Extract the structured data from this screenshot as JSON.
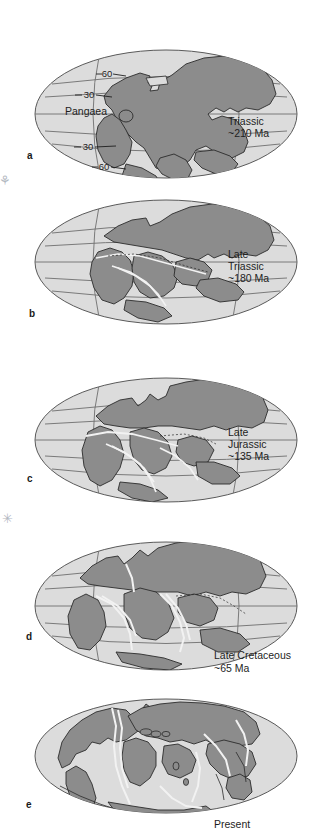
{
  "figure": {
    "colors": {
      "land": "#8c8c8c",
      "land_stroke": "#2b2b2b",
      "ocean": "#dcdcdc",
      "ocean_stroke": "#5a5a5a",
      "graticule": "#6e6e6e",
      "ridge": "#f2f2f2",
      "background": "#ffffff",
      "text": "#1e1e1e"
    }
  },
  "panels": [
    {
      "letter": "a",
      "caption": "Triassic\n~210 Ma",
      "caption_line1": "Triassic",
      "caption_line2": "~210 Ma",
      "supercontinent_label": "Pangaea",
      "latitude_labels": [
        "60",
        "30",
        "30",
        "60"
      ],
      "age_ma": 210,
      "epoch": "Triassic"
    },
    {
      "letter": "b",
      "caption": "Late\nTriassic\n~180 Ma",
      "caption_line1": "Late",
      "caption_line2": "Triassic",
      "caption_line3": "~180 Ma",
      "age_ma": 180,
      "epoch": "Late Triassic"
    },
    {
      "letter": "c",
      "caption": "Late\nJurassic\n~135 Ma",
      "caption_line1": "Late",
      "caption_line2": "Jurassic",
      "caption_line3": "~135 Ma",
      "age_ma": 135,
      "epoch": "Late Jurassic"
    },
    {
      "letter": "d",
      "caption": "Late Cretaceous\n~65 Ma",
      "caption_line1": "Late Cretaceous",
      "caption_line2": "~65 Ma",
      "age_ma": 65,
      "epoch": "Late Cretaceous"
    },
    {
      "letter": "e",
      "caption": "Present",
      "caption_line1": "Present",
      "age_ma": 0,
      "epoch": "Present"
    }
  ],
  "artifacts": {
    "mark_top": "⚘",
    "mark_mid": "✳"
  }
}
